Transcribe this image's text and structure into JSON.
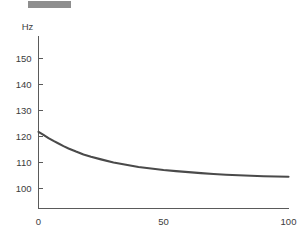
{
  "top_bar": {
    "name": "selection-bar",
    "color": "#8e8e8e"
  },
  "chart_data": {
    "type": "line",
    "title": "",
    "subtitle": "",
    "xlabel": "",
    "ylabel": "Hz",
    "ylabel_position": "axis-top",
    "grid": false,
    "legend": null,
    "xlim": [
      0,
      100
    ],
    "ylim": [
      95,
      157
    ],
    "xticks": [
      0,
      50,
      100
    ],
    "xticklabels": [
      "0",
      "50",
      "100"
    ],
    "yticks": [
      100,
      110,
      120,
      130,
      140,
      150
    ],
    "yticklabels": [
      "100",
      "110",
      "120",
      "130",
      "140",
      "150"
    ],
    "series": [
      {
        "name": "frequency-decay",
        "color": "#4a4a4a",
        "x": [
          0,
          2,
          4,
          6,
          8,
          10,
          12,
          15,
          18,
          21,
          25,
          30,
          35,
          40,
          45,
          50,
          55,
          60,
          65,
          70,
          75,
          80,
          85,
          90,
          95,
          100
        ],
        "y": [
          121.8,
          120.6,
          119.4,
          118.3,
          117.3,
          116.3,
          115.4,
          114.2,
          113.1,
          112.2,
          111.2,
          110.0,
          109.1,
          108.3,
          107.7,
          107.1,
          106.7,
          106.3,
          105.9,
          105.6,
          105.3,
          105.1,
          104.9,
          104.7,
          104.6,
          104.5
        ]
      }
    ],
    "axis_color": "#5a5a5a",
    "text_color": "#3c3c3c",
    "background": "#ffffff"
  }
}
